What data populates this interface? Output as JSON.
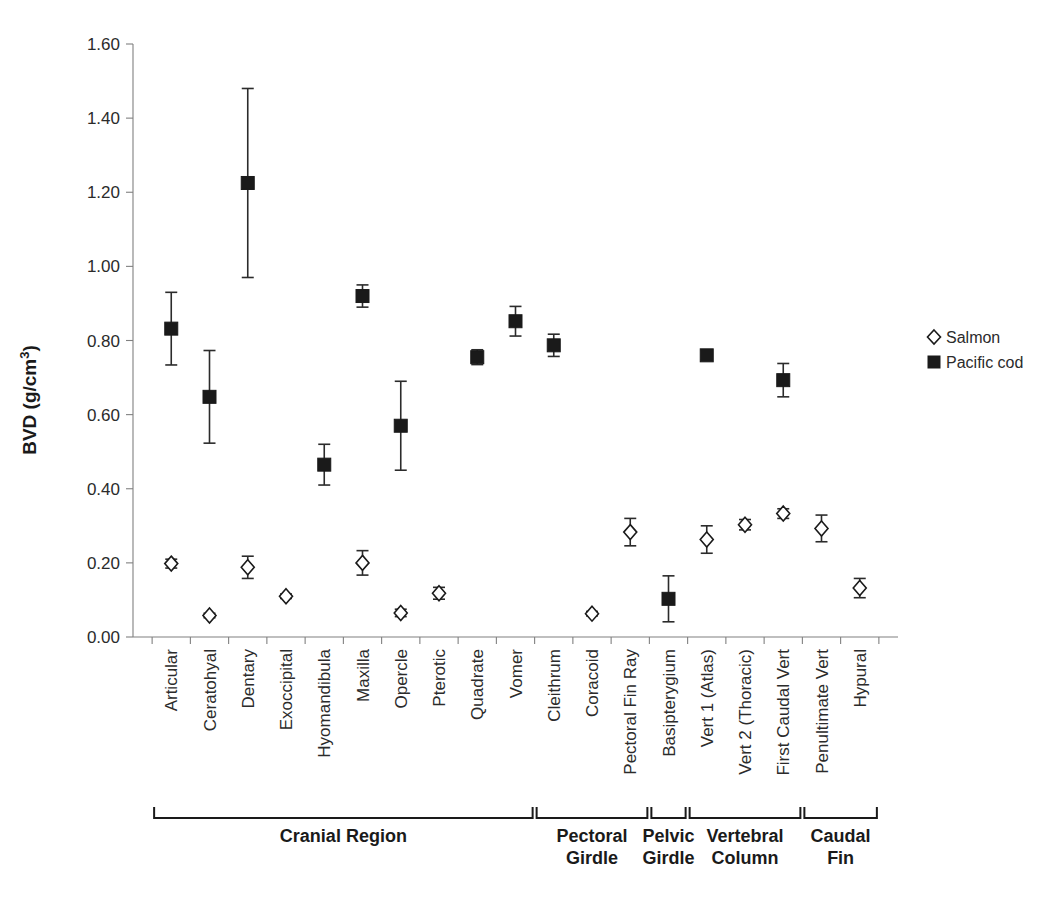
{
  "chart_data": {
    "type": "scatter",
    "title": "",
    "xlabel": "",
    "ylabel": "BVD (g/cm3)",
    "ylabel_display": "BVD (g/cm",
    "ylabel_sup": "3",
    "ylabel_tail": ")",
    "ylim": [
      0.0,
      1.6
    ],
    "ytick_labels": [
      "0.00",
      "0.20",
      "0.40",
      "0.60",
      "0.80",
      "1.00",
      "1.20",
      "1.40",
      "1.60"
    ],
    "ytick_values": [
      0.0,
      0.2,
      0.4,
      0.6,
      0.8,
      1.0,
      1.2,
      1.4,
      1.6
    ],
    "grid": false,
    "legend_position": "right",
    "categories": [
      "Articular",
      "Ceratohyal",
      "Dentary",
      "Exoccipital",
      "Hyomandibula",
      "Maxilla",
      "Opercle",
      "Pterotic",
      "Quadrate",
      "Vomer",
      "Cleithrum",
      "Coracoid",
      "Pectoral Fin Ray",
      "Basipterygium",
      "Vert 1 (Atlas)",
      "Vert 2 (Thoracic)",
      "First Caudal Vert",
      "Penultimate Vert",
      "Hypural"
    ],
    "series": [
      {
        "name": "Salmon",
        "marker": "open-diamond",
        "color": "#ffffff",
        "edge_color": "#1a1a1a",
        "values": [
          0.198,
          0.058,
          0.188,
          0.11,
          null,
          0.2,
          0.065,
          0.118,
          null,
          null,
          null,
          0.063,
          0.283,
          null,
          0.263,
          0.303,
          0.333,
          0.293,
          0.132
        ],
        "err_low": [
          0.012,
          0.006,
          0.03,
          0.006,
          null,
          0.033,
          0.01,
          0.016,
          null,
          null,
          null,
          0.006,
          0.037,
          null,
          0.037,
          0.014,
          0.013,
          0.036,
          0.026
        ],
        "err_high": [
          0.012,
          0.006,
          0.03,
          0.006,
          null,
          0.033,
          0.01,
          0.016,
          null,
          null,
          null,
          0.006,
          0.037,
          null,
          0.037,
          0.014,
          0.013,
          0.036,
          0.026
        ]
      },
      {
        "name": "Pacific cod",
        "marker": "filled-square",
        "color": "#1a1a1a",
        "edge_color": "#1a1a1a",
        "values": [
          0.832,
          0.648,
          1.225,
          null,
          0.465,
          0.92,
          0.57,
          null,
          0.755,
          0.852,
          0.787,
          null,
          null,
          0.103,
          0.76,
          null,
          0.693,
          null,
          null
        ],
        "err_low": [
          0.098,
          0.125,
          0.255,
          null,
          0.055,
          0.03,
          0.12,
          null,
          0.02,
          0.04,
          0.03,
          null,
          null,
          0.062,
          0.013,
          null,
          0.045,
          null,
          null
        ],
        "err_high": [
          0.098,
          0.125,
          0.255,
          null,
          0.055,
          0.03,
          0.12,
          null,
          0.02,
          0.04,
          0.03,
          null,
          null,
          0.062,
          0.013,
          null,
          0.045,
          null,
          null
        ]
      }
    ],
    "groups": [
      {
        "label": "Cranial Region",
        "label_line2": "",
        "start": 0,
        "end": 9
      },
      {
        "label": "Pectoral",
        "label_line2": "Girdle",
        "start": 10,
        "end": 12
      },
      {
        "label": "Pelvic",
        "label_line2": "Girdle",
        "start": 13,
        "end": 13
      },
      {
        "label": "Vertebral",
        "label_line2": "Column",
        "start": 14,
        "end": 16
      },
      {
        "label": "Caudal",
        "label_line2": "Fin",
        "start": 17,
        "end": 18
      }
    ]
  },
  "legend": {
    "items": [
      {
        "label": "Salmon",
        "marker": "open-diamond"
      },
      {
        "label": "Pacific cod",
        "marker": "filled-square"
      }
    ]
  },
  "colors": {
    "axis": "#808080",
    "text": "#1a1a1a",
    "marker_fill": "#1a1a1a",
    "background": "#ffffff"
  }
}
